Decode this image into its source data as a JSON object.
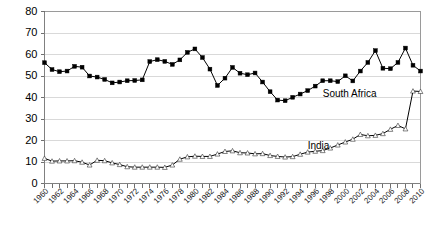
{
  "chart_data": {
    "type": "line",
    "title": "",
    "xlabel": "",
    "ylabel": "",
    "ylim": [
      0,
      80
    ],
    "xlim": [
      1960,
      2010
    ],
    "ytick_labels": [
      "0",
      "10",
      "20",
      "30",
      "40",
      "50",
      "60",
      "70",
      "80"
    ],
    "yticks": [
      0,
      10,
      20,
      30,
      40,
      50,
      60,
      70,
      80
    ],
    "grid": "horizontal",
    "legend_position": "inline-annotations",
    "x": [
      1960,
      1961,
      1962,
      1963,
      1964,
      1965,
      1966,
      1967,
      1968,
      1969,
      1970,
      1971,
      1972,
      1973,
      1974,
      1975,
      1976,
      1977,
      1978,
      1979,
      1980,
      1981,
      1982,
      1983,
      1984,
      1985,
      1986,
      1987,
      1988,
      1989,
      1990,
      1991,
      1992,
      1993,
      1994,
      1995,
      1996,
      1997,
      1998,
      1999,
      2000,
      2001,
      2002,
      2003,
      2004,
      2005,
      2006,
      2007,
      2008,
      2009,
      2010
    ],
    "xtick_labels": [
      "1960",
      "1962",
      "1964",
      "1966",
      "1968",
      "1970",
      "1972",
      "1974",
      "1976",
      "1978",
      "1980",
      "1982",
      "1984",
      "1986",
      "1988",
      "1990",
      "1992",
      "1994",
      "1996",
      "1998",
      "2000",
      "2002",
      "2004",
      "2006",
      "2008",
      "2010"
    ],
    "xtick_values": [
      1960,
      1962,
      1964,
      1966,
      1968,
      1970,
      1972,
      1974,
      1976,
      1978,
      1980,
      1982,
      1984,
      1986,
      1988,
      1990,
      1992,
      1994,
      1996,
      1998,
      2000,
      2002,
      2004,
      2006,
      2008,
      2010
    ],
    "series": [
      {
        "name": "South Africa",
        "marker": "filled-square",
        "label_x": 1997,
        "label_y": 41.5,
        "values": [
          56.2,
          53.0,
          52.0,
          52.3,
          54.5,
          54.1,
          50.0,
          49.5,
          48.4,
          46.8,
          47.2,
          47.8,
          47.9,
          48.2,
          56.7,
          57.6,
          56.8,
          55.4,
          57.5,
          61.0,
          62.6,
          58.6,
          53.2,
          45.6,
          49.0,
          54.0,
          51.3,
          50.6,
          51.4,
          47.2,
          42.7,
          38.8,
          38.5,
          40.1,
          41.6,
          43.2,
          45.3,
          47.8,
          47.8,
          47.4,
          50.1,
          47.7,
          52.3,
          56.3,
          61.8,
          53.6,
          53.4,
          56.3,
          63.0,
          63.9,
          73.4
        ]
      },
      {
        "name": "India",
        "marker": "open-triangle",
        "label_x": 1995,
        "label_y": 17.5,
        "values": [
          11.7,
          10.4,
          10.5,
          10.5,
          10.6,
          9.9,
          8.6,
          10.8,
          10.6,
          9.6,
          8.8,
          7.8,
          7.6,
          7.6,
          7.6,
          7.6,
          7.5,
          8.6,
          11.3,
          12.4,
          12.7,
          12.6,
          12.6,
          13.7,
          14.9,
          15.2,
          14.3,
          14.2,
          13.8,
          13.9,
          13.0,
          12.6,
          12.3,
          12.5,
          13.6,
          14.6,
          15.0,
          15.3,
          16.5,
          17.9,
          19.3,
          20.6,
          22.8,
          22.2,
          22.4,
          23.2,
          25.2,
          27.0,
          25.4,
          30.2,
          30.4
        ]
      }
    ],
    "series_tail": [
      {
        "name": "South Africa",
        "x": [
          2009,
          2010
        ],
        "values": [
          55.0,
          52.3
        ]
      },
      {
        "name": "India",
        "x": [
          2009,
          2010
        ],
        "values": [
          43.0,
          42.8
        ]
      }
    ]
  },
  "colors": {
    "series_line": "#000000",
    "grid": "#d9d9d9",
    "axis": "#808080",
    "text": "#000000",
    "background": "#ffffff"
  }
}
